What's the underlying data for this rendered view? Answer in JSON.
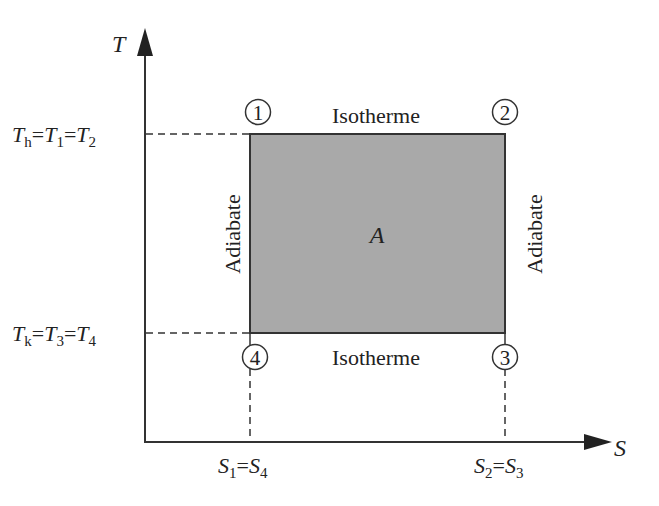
{
  "diagram": {
    "axes": {
      "y_label": "T",
      "x_label": "S"
    },
    "y_ticks": [
      {
        "main": "T",
        "sub": "h",
        "eq1": "T",
        "sub1": "1",
        "eq2": "T",
        "sub2": "2"
      },
      {
        "main": "T",
        "sub": "k",
        "eq1": "T",
        "sub1": "3",
        "eq2": "T",
        "sub2": "4"
      }
    ],
    "x_ticks": [
      {
        "main": "S",
        "sub": "1",
        "eq": "S",
        "sub2": "4"
      },
      {
        "main": "S",
        "sub": "2",
        "eq": "S",
        "sub2": "3"
      }
    ],
    "states": [
      "1",
      "2",
      "3",
      "4"
    ],
    "edges": {
      "top": "Isotherme",
      "bottom": "Isotherme",
      "left": "Adiabate",
      "right": "Adiabate"
    },
    "area_label": "A",
    "colors": {
      "fill": "#a9a9a9",
      "line": "#333333",
      "text": "#222222"
    }
  }
}
